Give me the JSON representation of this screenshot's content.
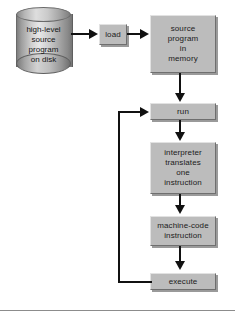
{
  "diagram": {
    "type": "flowchart",
    "colors": {
      "node_fill": "#bcbcbc",
      "node_border_light": "#e2e2e2",
      "node_border_dark": "#6f6f6f",
      "connector": "#111111",
      "background": "#ffffff",
      "rule": "#8c8c8c"
    },
    "nodes": [
      {
        "id": "disk",
        "label": "high-level\nsource\nprogram\non disk",
        "shape": "cylinder"
      },
      {
        "id": "load",
        "label": "load",
        "shape": "rect"
      },
      {
        "id": "source-mem",
        "label": "source\nprogram\nin\nmemory",
        "shape": "rect"
      },
      {
        "id": "run",
        "label": "run",
        "shape": "rect"
      },
      {
        "id": "interpreter",
        "label": "interpreter\ntranslates\none\ninstruction",
        "shape": "rect"
      },
      {
        "id": "machine",
        "label": "machine-code\ninstruction",
        "shape": "rect"
      },
      {
        "id": "execute",
        "label": "execute",
        "shape": "rect"
      }
    ],
    "edges": [
      {
        "from": "disk",
        "to": "load",
        "direction": "right"
      },
      {
        "from": "load",
        "to": "source-mem",
        "direction": "right"
      },
      {
        "from": "source-mem",
        "to": "run",
        "direction": "down"
      },
      {
        "from": "run",
        "to": "interpreter",
        "direction": "down"
      },
      {
        "from": "interpreter",
        "to": "machine",
        "direction": "down"
      },
      {
        "from": "machine",
        "to": "execute",
        "direction": "down"
      },
      {
        "from": "execute",
        "to": "run",
        "direction": "loop-left-up"
      }
    ]
  }
}
